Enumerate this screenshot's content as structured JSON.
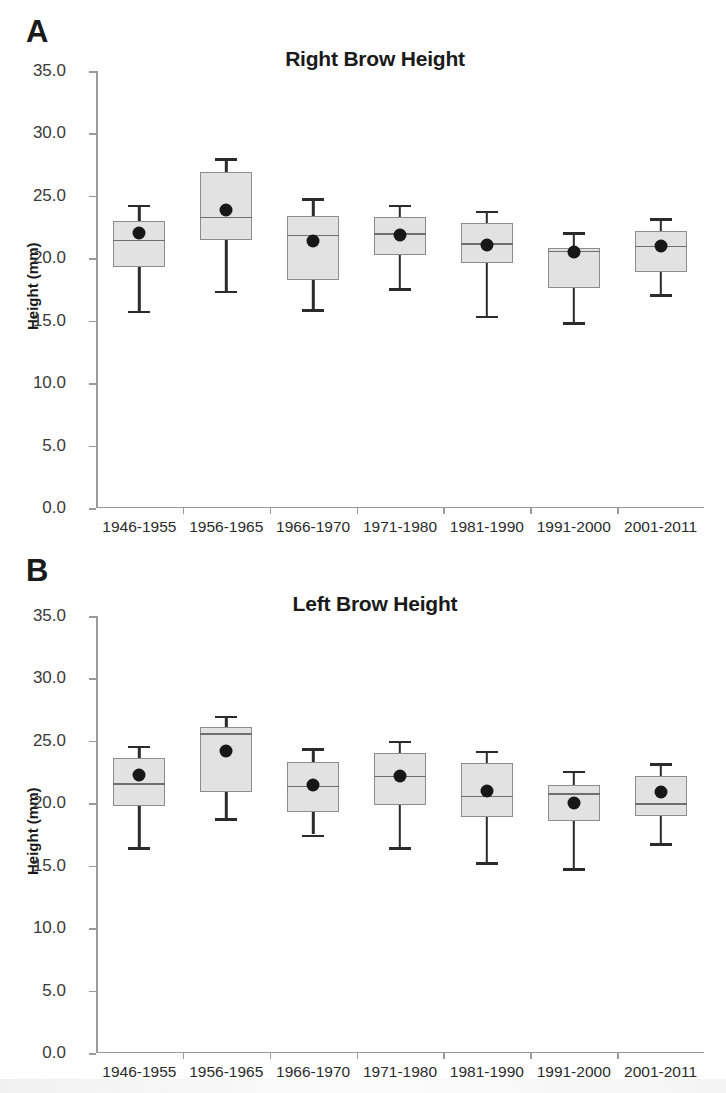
{
  "figure": {
    "background": "#ffffff",
    "box_fill": "#e2e2e2",
    "box_stroke": "#8d8d8d",
    "whisker_color": "#2b2b2b",
    "mean_marker_color": "#171717"
  },
  "panels": [
    {
      "letter": "A",
      "title": "Right Brow Height",
      "ylabel": "Height (mm)",
      "chart_data": {
        "type": "box",
        "title": "Right Brow Height",
        "xlabel": "",
        "ylabel": "Height (mm)",
        "ylim": [
          0.0,
          35.0
        ],
        "ytick_labels": [
          "0.0",
          "5.0",
          "10.0",
          "15.0",
          "20.0",
          "25.0",
          "30.0",
          "35.0"
        ],
        "ytick_values": [
          0.0,
          5.0,
          10.0,
          15.0,
          20.0,
          25.0,
          30.0,
          35.0
        ],
        "grid": false,
        "legend": "none",
        "categories": [
          "1946-1955",
          "1956-1965",
          "1966-1970",
          "1971-1980",
          "1981-1990",
          "1991-2000",
          "2001-2011"
        ],
        "boxes": [
          {
            "category": "1946-1955",
            "whisker_low": 15.8,
            "q1": 19.3,
            "median": 21.5,
            "q3": 23.0,
            "whisker_high": 24.3,
            "mean": 22.0
          },
          {
            "category": "1956-1965",
            "whisker_low": 17.4,
            "q1": 21.5,
            "median": 23.3,
            "q3": 26.9,
            "whisker_high": 28.0,
            "mean": 23.9
          },
          {
            "category": "1966-1970",
            "whisker_low": 15.9,
            "q1": 18.3,
            "median": 21.9,
            "q3": 23.4,
            "whisker_high": 24.8,
            "mean": 21.4
          },
          {
            "category": "1971-1980",
            "whisker_low": 17.6,
            "q1": 20.3,
            "median": 22.0,
            "q3": 23.3,
            "whisker_high": 24.3,
            "mean": 21.9
          },
          {
            "category": "1981-1990",
            "whisker_low": 15.4,
            "q1": 19.6,
            "median": 21.2,
            "q3": 22.8,
            "whisker_high": 23.8,
            "mean": 21.1
          },
          {
            "category": "1991-2000",
            "whisker_low": 14.9,
            "q1": 17.6,
            "median": 20.6,
            "q3": 20.8,
            "whisker_high": 22.1,
            "mean": 20.5
          },
          {
            "category": "2001-2011",
            "whisker_low": 17.1,
            "q1": 18.9,
            "median": 21.0,
            "q3": 22.2,
            "whisker_high": 23.2,
            "mean": 21.0
          }
        ]
      }
    },
    {
      "letter": "B",
      "title": "Left Brow Height",
      "ylabel": "Height (mm)",
      "chart_data": {
        "type": "box",
        "title": "Left Brow Height",
        "xlabel": "",
        "ylabel": "Height (mm)",
        "ylim": [
          0.0,
          35.0
        ],
        "ytick_labels": [
          "0.0",
          "5.0",
          "10.0",
          "15.0",
          "20.0",
          "25.0",
          "30.0",
          "35.0"
        ],
        "ytick_values": [
          0.0,
          5.0,
          10.0,
          15.0,
          20.0,
          25.0,
          30.0,
          35.0
        ],
        "grid": false,
        "legend": "none",
        "categories": [
          "1946-1955",
          "1956-1965",
          "1966-1970",
          "1971-1980",
          "1981-1990",
          "1991-2000",
          "2001-2011"
        ],
        "boxes": [
          {
            "category": "1946-1955",
            "whisker_low": 16.5,
            "q1": 19.8,
            "median": 21.6,
            "q3": 23.6,
            "whisker_high": 24.6,
            "mean": 22.3
          },
          {
            "category": "1956-1965",
            "whisker_low": 18.8,
            "q1": 20.9,
            "median": 25.6,
            "q3": 26.1,
            "whisker_high": 27.0,
            "mean": 24.2
          },
          {
            "category": "1966-1970",
            "whisker_low": 17.5,
            "q1": 19.3,
            "median": 21.4,
            "q3": 23.3,
            "whisker_high": 24.4,
            "mean": 21.5
          },
          {
            "category": "1971-1980",
            "whisker_low": 16.5,
            "q1": 19.9,
            "median": 22.2,
            "q3": 24.0,
            "whisker_high": 25.0,
            "mean": 22.2
          },
          {
            "category": "1981-1990",
            "whisker_low": 15.3,
            "q1": 18.9,
            "median": 20.6,
            "q3": 23.2,
            "whisker_high": 24.2,
            "mean": 21.0
          },
          {
            "category": "1991-2000",
            "whisker_low": 14.8,
            "q1": 18.6,
            "median": 20.8,
            "q3": 21.5,
            "whisker_high": 22.6,
            "mean": 20.0
          },
          {
            "category": "2001-2011",
            "whisker_low": 16.8,
            "q1": 19.0,
            "median": 20.0,
            "q3": 22.2,
            "whisker_high": 23.2,
            "mean": 20.9
          }
        ]
      }
    }
  ]
}
